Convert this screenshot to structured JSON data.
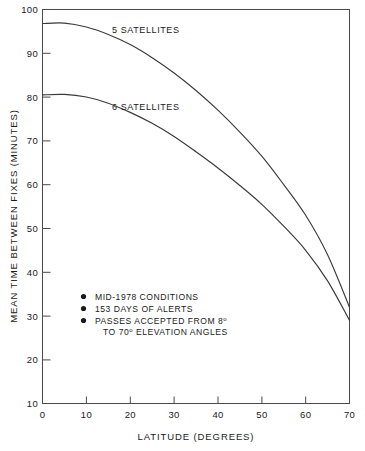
{
  "chart_data": {
    "type": "line",
    "title": "",
    "subtitle": "",
    "xlabel": "LATITUDE (DEGREES)",
    "ylabel": "MEAN TIME BETWEEN FIXES (MINUTES)",
    "xlim": [
      0,
      70
    ],
    "ylim": [
      10,
      100
    ],
    "xticks": [
      0,
      10,
      20,
      30,
      40,
      50,
      60,
      70
    ],
    "yticks": [
      10,
      20,
      30,
      40,
      50,
      60,
      70,
      80,
      90,
      100
    ],
    "xtick_labels": [
      "0",
      "10",
      "20",
      "30",
      "40",
      "50",
      "60",
      "70"
    ],
    "ytick_labels": [
      "10",
      "20",
      "30",
      "40",
      "50",
      "60",
      "70",
      "80",
      "90",
      "100"
    ],
    "grid": false,
    "legend_position": "inline-curve-labels",
    "x": [
      0,
      5,
      10,
      15,
      20,
      25,
      30,
      35,
      40,
      45,
      50,
      55,
      60,
      65,
      70
    ],
    "series": [
      {
        "name": "5 SATELLITES",
        "label": "5 SATELLITES",
        "values": [
          96.8,
          96.9,
          96.0,
          94.3,
          92.0,
          89.0,
          85.5,
          81.5,
          77.0,
          72.0,
          66.5,
          60.0,
          53.0,
          44.0,
          32.0
        ]
      },
      {
        "name": "6 SATELLITES",
        "label": "6 SATELLITES",
        "values": [
          80.5,
          80.6,
          80.0,
          78.6,
          76.5,
          74.0,
          71.0,
          67.5,
          63.8,
          59.8,
          55.5,
          50.5,
          45.0,
          38.0,
          29.0
        ]
      }
    ],
    "annotations": {
      "bullets": [
        "MID-1978 CONDITIONS",
        "153 DAYS OF ALERTS"
      ],
      "bullet_three_prefix": "PASSES ACCEPTED FROM 8",
      "bullet_three_sup": "o",
      "bullet_three_line2_prefix": "TO 70",
      "bullet_three_line2_sup": "o",
      "bullet_three_line2_suffix": " ELEVATION ANGLES"
    }
  },
  "style": {
    "axis_color": "#4a4a4a",
    "curve_color": "#3a3a3a",
    "text_color": "#1a1a1a",
    "background": "#ffffff"
  }
}
